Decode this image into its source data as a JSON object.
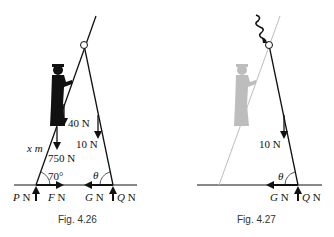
{
  "figures": [
    {
      "id": "fig-4-26",
      "caption": "Fig. 4.26",
      "labels": {
        "force_40": "40 N",
        "force_10": "10 N",
        "force_750": "750 N",
        "length": "x m",
        "angle_left": "70°",
        "angle_right": "θ",
        "P_sym": "P",
        "P_unit": " N",
        "F_sym": "F",
        "F_unit": " N",
        "G_sym": "G",
        "G_unit": " N",
        "Q_sym": "Q",
        "Q_unit": " N"
      }
    },
    {
      "id": "fig-4-27",
      "caption": "Fig. 4.27",
      "labels": {
        "force_10": "10 N",
        "angle": "θ",
        "G_sym": "G",
        "G_unit": " N",
        "Q_sym": "Q",
        "Q_unit": " N"
      }
    }
  ],
  "colors": {
    "ink": "#111111",
    "ghost": "#bdbdbd"
  }
}
